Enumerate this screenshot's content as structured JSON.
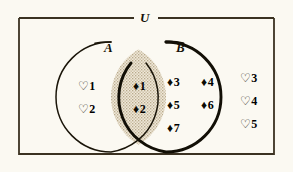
{
  "diagram": {
    "type": "venn-two-set",
    "universe_label": "U",
    "set_a_label": "A",
    "set_b_label": "B",
    "shaded_region": "A-intersect-B",
    "colors": {
      "background": "#fbf9f2",
      "outline": "#1a1509",
      "shade_fill": "#e2d9c6",
      "glyph": "#0d0b04"
    }
  },
  "regions": {
    "a_only": {
      "name": "A only",
      "glyph": "heart-outline",
      "items": [
        {
          "glyph": "♡",
          "num": "1"
        },
        {
          "glyph": "♡",
          "num": "2"
        }
      ]
    },
    "intersection": {
      "name": "A intersect B",
      "glyph": "diamond-filled",
      "shaded": true,
      "items": [
        {
          "glyph": "♦",
          "num": "1"
        },
        {
          "glyph": "♦",
          "num": "2"
        }
      ]
    },
    "b_only": {
      "name": "B only",
      "glyph": "diamond-filled",
      "items": [
        {
          "glyph": "♦",
          "num": "3"
        },
        {
          "glyph": "♦",
          "num": "4"
        },
        {
          "glyph": "♦",
          "num": "5"
        },
        {
          "glyph": "♦",
          "num": "6"
        },
        {
          "glyph": "♦",
          "num": "7"
        }
      ]
    },
    "outside": {
      "name": "outside A and B",
      "glyph": "heart-outline",
      "items": [
        {
          "glyph": "♡",
          "num": "3"
        },
        {
          "glyph": "♡",
          "num": "4"
        },
        {
          "glyph": "♡",
          "num": "5"
        }
      ]
    }
  }
}
